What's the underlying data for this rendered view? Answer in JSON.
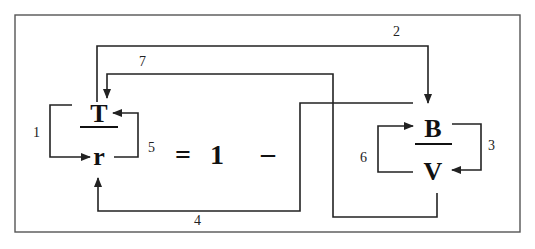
{
  "equation": {
    "left_numerator": "T",
    "left_denominator": "r",
    "equals": "=",
    "one": "1",
    "minus": "–",
    "right_numerator": "B",
    "right_denominator": "V"
  },
  "arrow_labels": {
    "a1": "1",
    "a2": "2",
    "a3": "3",
    "a4": "4",
    "a5": "5",
    "a6": "6",
    "a7": "7"
  },
  "colors": {
    "line": "#222222",
    "text": "#111111",
    "frame": "#555555",
    "background": "#ffffff"
  }
}
